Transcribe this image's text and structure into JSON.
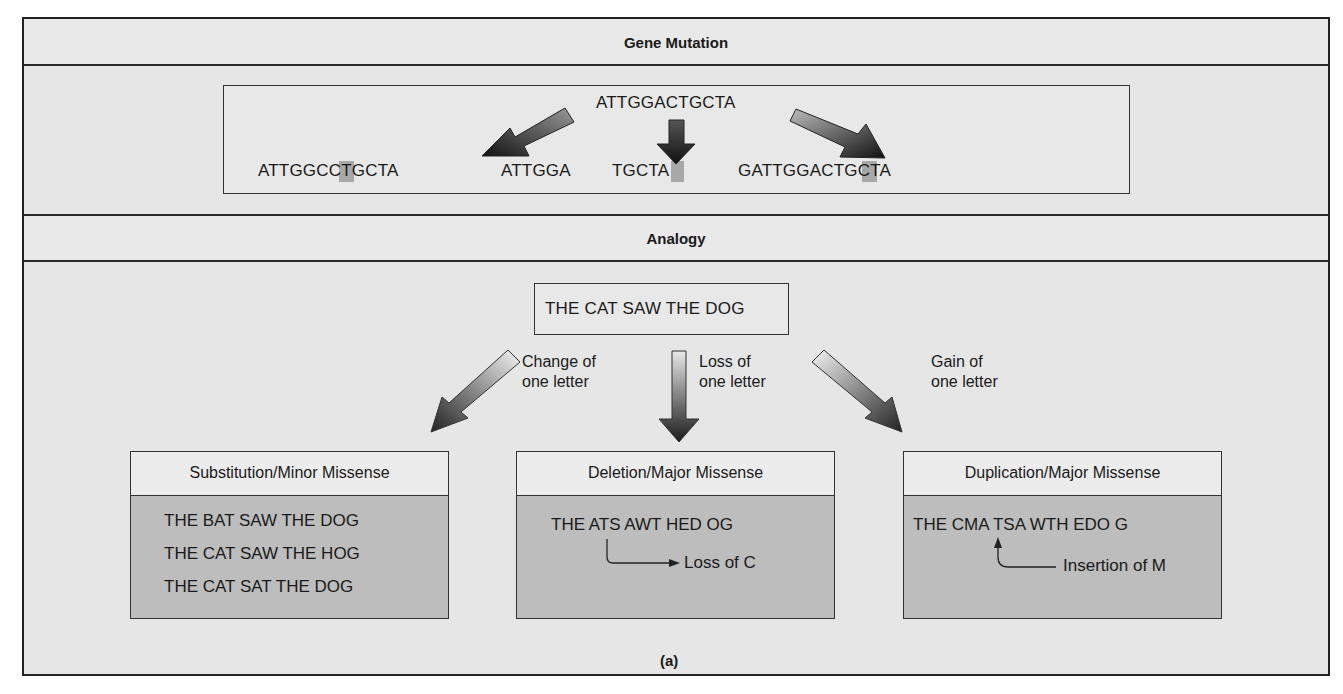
{
  "figure": {
    "sections": {
      "gene_mutation": {
        "title": "Gene Mutation",
        "original": "ATTGGACTGCTA",
        "variants": [
          {
            "type": "substitution",
            "sequence": "ATTGGCCTGCTA",
            "highlight_index": 7
          },
          {
            "type": "deletion",
            "left": "ATTGGA",
            "right": "TGCTA"
          },
          {
            "type": "insertion",
            "sequence": "GATTGGACTGCTA",
            "highlight_index": 9
          }
        ]
      },
      "analogy": {
        "title": "Analogy",
        "sentence": "THE CAT SAW THE DOG",
        "arrows": [
          {
            "label_line1": "Change of",
            "label_line2": "one letter"
          },
          {
            "label_line1": "Loss of",
            "label_line2": "one letter"
          },
          {
            "label_line1": "Gain of",
            "label_line2": "one letter"
          }
        ],
        "boxes": [
          {
            "title": "Substitution/Minor Missense",
            "lines": [
              "THE BAT SAW THE DOG",
              "THE CAT SAW THE HOG",
              "THE CAT SAT THE DOG"
            ]
          },
          {
            "title": "Deletion/Major Missense",
            "lines": [
              "THE ATS AWT HED OG"
            ],
            "annotation": "Loss of C"
          },
          {
            "title": "Duplication/Major Missense",
            "lines": [
              "THE CMA TSA WTH EDO G"
            ],
            "annotation": "Insertion of M"
          }
        ]
      }
    },
    "caption": "(a)",
    "colors": {
      "background": "#e6e6e6",
      "box_fill": "#bdbdbd",
      "header_fill": "#ececec",
      "highlight": "#a8a8a8",
      "border": "#222222"
    }
  }
}
